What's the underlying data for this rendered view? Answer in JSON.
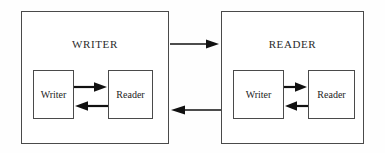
{
  "diagram": {
    "type": "block-diagram",
    "background_color": "#fefefe",
    "stroke_color": "#111111",
    "border_color": "#4a4a4a",
    "panels": [
      {
        "id": "writer-panel",
        "title": "WRITER",
        "inner": [
          {
            "id": "writer-inner-writer",
            "label": "Writer"
          },
          {
            "id": "writer-inner-reader",
            "label": "Reader"
          }
        ]
      },
      {
        "id": "reader-panel",
        "title": "READER",
        "inner": [
          {
            "id": "reader-inner-writer",
            "label": "Writer"
          },
          {
            "id": "reader-inner-reader",
            "label": "Reader"
          }
        ]
      }
    ],
    "connectors": [
      {
        "id": "writer-to-reader",
        "direction": "right",
        "scope": "between-panels",
        "label": ""
      },
      {
        "id": "reader-to-writer",
        "direction": "left",
        "scope": "between-panels",
        "label": ""
      },
      {
        "id": "writer-panel-inner-forward",
        "direction": "right",
        "scope": "within-writer-panel",
        "label": ""
      },
      {
        "id": "writer-panel-inner-back",
        "direction": "left",
        "scope": "within-writer-panel",
        "label": ""
      },
      {
        "id": "reader-panel-inner-forward",
        "direction": "right",
        "scope": "within-reader-panel",
        "label": ""
      },
      {
        "id": "reader-panel-inner-back",
        "direction": "left",
        "scope": "within-reader-panel",
        "label": ""
      }
    ]
  }
}
